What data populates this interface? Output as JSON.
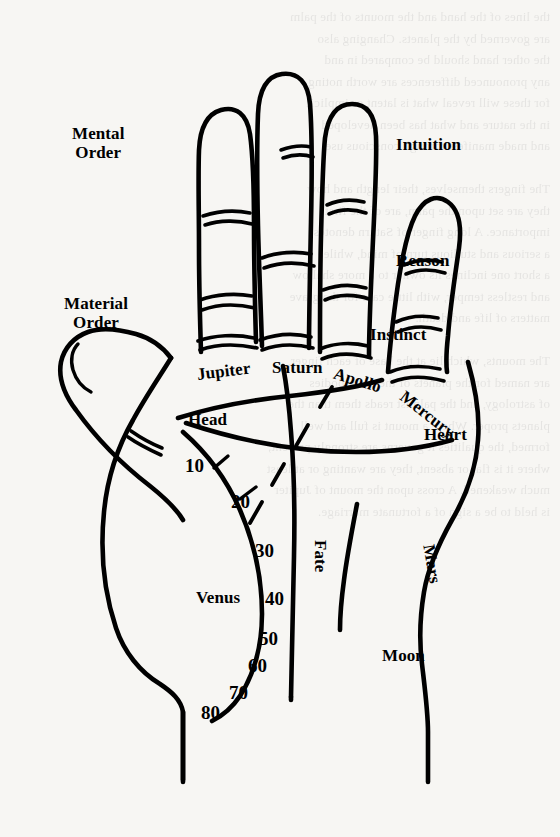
{
  "diagram": {
    "type": "annotated-hand-diagram",
    "ink_color": "#000000",
    "paper_color": "#f7f6f3",
    "hand": "left palm, fingers up"
  },
  "labels": {
    "left_side": [
      {
        "id": "mental-order",
        "text": "Mental\nOrder",
        "x": 72,
        "y": 124,
        "size": 17,
        "rotation": 0
      },
      {
        "id": "material-order",
        "text": "Material\nOrder",
        "x": 64,
        "y": 294,
        "size": 17,
        "rotation": 0
      }
    ],
    "right_side": [
      {
        "id": "intuition",
        "text": "Intuition",
        "x": 396,
        "y": 135,
        "size": 17,
        "rotation": 0
      },
      {
        "id": "reason",
        "text": "Reason",
        "x": 396,
        "y": 251,
        "size": 17,
        "rotation": 0
      },
      {
        "id": "instinct",
        "text": "Instinct",
        "x": 370,
        "y": 325,
        "size": 17,
        "rotation": 0
      }
    ],
    "finger_mounts": [
      {
        "id": "jupiter",
        "text": "Jupiter",
        "x": 196,
        "y": 365,
        "size": 17,
        "rotation": -7
      },
      {
        "id": "saturn",
        "text": "Saturn",
        "x": 272,
        "y": 358,
        "size": 17,
        "rotation": 0
      },
      {
        "id": "apollo",
        "text": "Apollo",
        "x": 337,
        "y": 364,
        "size": 17,
        "rotation": 17
      },
      {
        "id": "mercury",
        "text": "Mercury",
        "x": 408,
        "y": 387,
        "size": 17,
        "rotation": 38
      }
    ],
    "lines": [
      {
        "id": "head",
        "text": "Head",
        "x": 188,
        "y": 410,
        "size": 17,
        "rotation": 0
      },
      {
        "id": "heart",
        "text": "Heart",
        "x": 424,
        "y": 425,
        "size": 17,
        "rotation": 0
      },
      {
        "id": "fate",
        "text": "Fate",
        "x": 330,
        "y": 540,
        "size": 17,
        "rotation": 90
      }
    ],
    "mounts": [
      {
        "id": "venus",
        "text": "Venus",
        "x": 196,
        "y": 588,
        "size": 17,
        "rotation": 0
      },
      {
        "id": "moon",
        "text": "Moon",
        "x": 382,
        "y": 646,
        "size": 17,
        "rotation": 0
      },
      {
        "id": "mars",
        "text": "Mars",
        "x": 438,
        "y": 543,
        "size": 17,
        "rotation": 80
      }
    ]
  },
  "life_line_ages": [
    {
      "value": "10",
      "x": 185,
      "y": 455
    },
    {
      "value": "20",
      "x": 231,
      "y": 491
    },
    {
      "value": "30",
      "x": 255,
      "y": 540
    },
    {
      "value": "40",
      "x": 265,
      "y": 588
    },
    {
      "value": "50",
      "x": 259,
      "y": 628
    },
    {
      "value": "60",
      "x": 248,
      "y": 655
    },
    {
      "value": "70",
      "x": 229,
      "y": 682
    },
    {
      "value": "80",
      "x": 201,
      "y": 702
    }
  ],
  "bleed_through_text": {
    "note": "faint mirrored text showing through from the reverse side of the page",
    "lines": [
      "the lines of the hand and the mounts of the palm",
      "are governed by the planets. Changing also",
      "the other hand should be compared in and",
      "any pronounced differences are worth noting,",
      "for these will reveal what is latent or implicit",
      "in the nature and what has been developed",
      "and made manifest through conscious use.",
      "",
      "The fingers themselves, their length and how",
      "they are set upon the palm, are of the first",
      "importance. A long finger of Saturn denotes",
      "a serious and studious turn of mind, while",
      "a short one inclines its owner to a more shallow",
      "and restless temper, with little care for the grave",
      "matters of life and death.",
      "",
      "The mounts, which lie at the base of each finger,",
      "are named for the planets of the older bodies",
      "of astrology, and the palmist reads them than the",
      "planets proper. Where a mount is full and well",
      "formed, the qualities it governs are strongly present;",
      "where it is flat or absent, they are wanting or at least",
      "much weakened. A cross upon the mount of Jupiter",
      "is held to be a sign of a fortunate marriage."
    ]
  },
  "features": {
    "fingers": [
      "Jupiter",
      "Saturn",
      "Apollo",
      "Mercury"
    ],
    "thumb": true,
    "knuckle_creases": true,
    "dashed_line": "sun/apollo line",
    "wrist_lines": 2
  }
}
